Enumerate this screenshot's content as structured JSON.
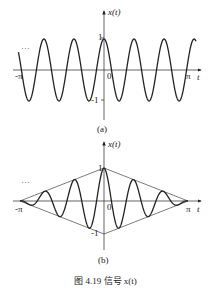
{
  "caption": "图 4.19   信号 x(t)",
  "chart_data": [
    {
      "type": "line",
      "panel": "(a)",
      "title": "",
      "ylabel": "x(t)",
      "xlabel": "t",
      "x_ticks": [
        "-π",
        "0",
        "π"
      ],
      "y_ticks": [
        "1",
        "-1"
      ],
      "continuation_marker": "…",
      "function": "cos(ωt), periodic, extends beyond [-π, π]",
      "xlim": [
        -3.5,
        3.5
      ],
      "ylim": [
        -1.5,
        1.5
      ],
      "peaks_t_approx": [
        -2.2,
        -1.1,
        0,
        1.1,
        2.2
      ],
      "amplitude": 1
    },
    {
      "type": "line",
      "panel": "(b)",
      "title": "",
      "ylabel": "x(t)",
      "xlabel": "t",
      "x_ticks": [
        "-π",
        "0",
        "π"
      ],
      "y_ticks": [
        "1",
        "-1"
      ],
      "continuation_marker": "…",
      "function": "(1 - |t|/π)·cos(ωt) for |t| ≤ π, with triangular envelope ±(1 - |t|/π)",
      "envelope": "triangle from (-π,0) to (0,±1) to (π,0)",
      "xlim": [
        -3.5,
        3.5
      ],
      "ylim": [
        -1.5,
        1.5
      ],
      "amplitude": 1
    }
  ],
  "panels": {
    "a": {
      "ylabel": "x(t)",
      "xlabel": "t",
      "neg_pi": "-π",
      "pi": "π",
      "zero": "0",
      "one": "1",
      "neg_one": "-1",
      "dots": "…",
      "tag": "(a)"
    },
    "b": {
      "ylabel": "x(t)",
      "xlabel": "t",
      "neg_pi": "-π",
      "pi": "π",
      "zero": "0",
      "one": "1",
      "neg_one": "-1",
      "dots": "…",
      "tag": "(b)"
    }
  }
}
